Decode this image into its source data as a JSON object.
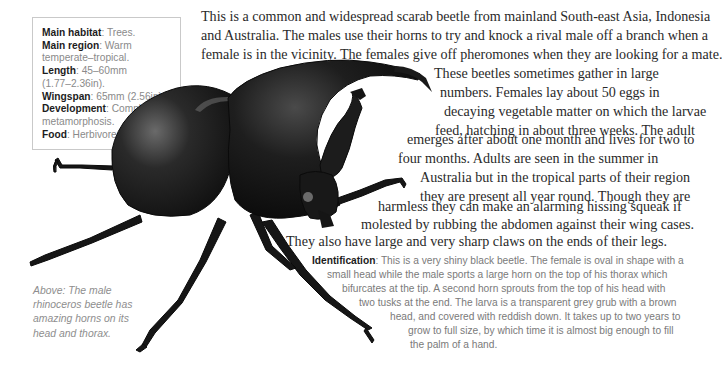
{
  "infobox": {
    "rows": [
      {
        "label": "Main habitat",
        "sep": ": ",
        "value": "Trees."
      },
      {
        "label": "Main region",
        "sep": ": ",
        "value": "Warm"
      },
      {
        "label": "",
        "sep": "",
        "value": "temperate–tropical."
      },
      {
        "label": "Length",
        "sep": ": ",
        "value": "45–60mm"
      },
      {
        "label": "",
        "sep": "",
        "value": "(1.77–2.36in)."
      },
      {
        "label": "Wingspan",
        "sep": ": ",
        "value": "65mm (2.56in)."
      },
      {
        "label": "Development",
        "sep": ": ",
        "value": "Complete"
      },
      {
        "label": "",
        "sep": "",
        "value": "metamorphosis."
      },
      {
        "label": "Food",
        "sep": ": ",
        "value": "Herbivore."
      }
    ]
  },
  "body_text": {
    "lines": [
      "This is a common and widespread scarab beetle from mainland South-east Asia, Indonesia",
      "and Australia. The males use their horns to try and knock a rival male off a branch when a",
      "female is in the vicinity. The females give off pheromones when they are looking for a mate.",
      "These beetles sometimes gather in large",
      "numbers. Females lay about 50 eggs in",
      "decaying vegetable matter on which the larvae",
      "feed, hatching in about three weeks. The adult",
      "emerges after about one month and lives for two to",
      "four months. Adults are seen in the summer in",
      "Australia but in the tropical parts of their region",
      "they are present all year round. Though they are",
      "harmless they can make an alarming hissing squeak if",
      "molested by rubbing the abdomen against their wing cases.",
      "They also have large and very sharp claws on the ends of their legs."
    ]
  },
  "identification": {
    "label": "Identification",
    "sep": ": ",
    "lines": [
      "This is a very shiny black beetle. The female is oval in shape with a",
      "small head while the male sports a large horn on the top of his thorax which",
      "bifurcates at the tip. A second horn sprouts from the top of his head with",
      "two tusks at the end. The larva is a transparent grey grub with a brown",
      "head, and covered with reddish down. It takes up to two years to",
      "grow to full size, by which time it is almost big enough to fill",
      "the palm of a hand."
    ]
  },
  "caption": {
    "lines": [
      "Above: The male",
      "rhinoceros beetle has",
      "amazing horns on its",
      "head and thorax."
    ]
  },
  "illustration": {
    "subject": "male rhinoceros beetle",
    "colors": {
      "body": "#141414",
      "highlight": "#5a5a5a"
    }
  }
}
